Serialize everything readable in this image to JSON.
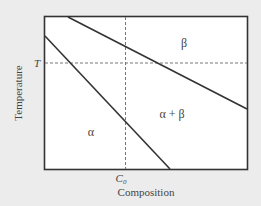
{
  "diagram": {
    "type": "binary phase diagram",
    "xlabel": "Composition",
    "ylabel": "Temperature",
    "x_marker_label": "C",
    "x_marker_subscript": "0",
    "y_marker_label": "T",
    "regions": {
      "beta": "β",
      "alpha_beta": "α + β",
      "alpha": "α"
    },
    "colors": {
      "background": "#ececec",
      "plot_area": "#ffffff",
      "lines": "#333333",
      "guides": "#777777",
      "text": "#444444"
    }
  }
}
